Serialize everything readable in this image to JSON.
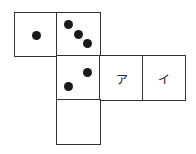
{
  "diagram": {
    "type": "cube-net",
    "faces": [
      {
        "id": "face-1",
        "row": 0,
        "col": 0,
        "pips": 1,
        "label": ""
      },
      {
        "id": "face-3",
        "row": 0,
        "col": 1,
        "pips": 3,
        "label": ""
      },
      {
        "id": "face-2",
        "row": 1,
        "col": 1,
        "pips": 2,
        "label": ""
      },
      {
        "id": "face-a",
        "row": 1,
        "col": 2,
        "pips": 0,
        "label": "ア"
      },
      {
        "id": "face-i",
        "row": 1,
        "col": 3,
        "pips": 0,
        "label": "イ"
      },
      {
        "id": "face-blank",
        "row": 2,
        "col": 1,
        "pips": 0,
        "label": ""
      }
    ]
  },
  "labels": {
    "a": "ア",
    "i": "イ"
  }
}
